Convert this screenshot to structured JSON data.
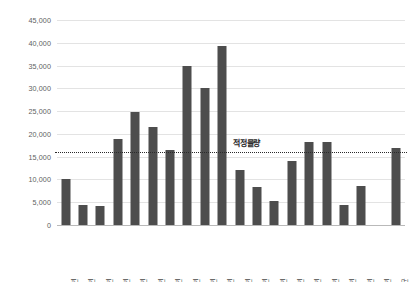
{
  "chart_data": {
    "type": "bar",
    "title": "",
    "subtitle": "",
    "xlabel": "",
    "ylabel": "",
    "ylim": [
      0,
      45000
    ],
    "ytick_values": [
      0,
      5000,
      10000,
      15000,
      20000,
      25000,
      30000,
      35000,
      40000,
      45000
    ],
    "ytick_labels": [
      "0",
      "5,000",
      "10,000",
      "15,000",
      "20,000",
      "25,000",
      "30,000",
      "35,000",
      "40,000",
      "45,000"
    ],
    "grid": true,
    "legend": "none",
    "bar_color": "#4d4d4d",
    "gridline_color": "#e3e3e3",
    "categories": [
      "2010년",
      "2011년",
      "2012년",
      "2013년",
      "2014년",
      "2015년",
      "2016년",
      "2017년",
      "2018년",
      "2019년",
      "2020년",
      "2021년",
      "2022년",
      "2023년",
      "2024년",
      "2025년",
      "2026년",
      "2027년",
      "2028년",
      "평균"
    ],
    "values": [
      10100,
      4300,
      4200,
      18800,
      24800,
      21500,
      16500,
      35000,
      30100,
      39200,
      12000,
      8300,
      5300,
      14000,
      18300,
      18200,
      4400,
      8500,
      null,
      17000
    ],
    "annotations": [
      {
        "name": "threshold-line",
        "label": "적정물량",
        "value": 16000,
        "style": "dotted",
        "color": "#2b2b2b"
      }
    ]
  }
}
